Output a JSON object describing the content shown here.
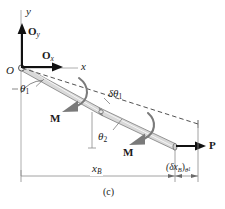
{
  "figure": {
    "caption": "(c)",
    "axes": {
      "y_axis_label": "y",
      "x_axis_label": "x"
    },
    "reactions": [
      {
        "name": "O-y-reaction",
        "base": "O",
        "subscript": "y"
      },
      {
        "name": "O-x-reaction",
        "base": "O",
        "subscript": "x"
      }
    ],
    "origin_label": "O",
    "angles": [
      {
        "name": "theta-1",
        "base": "θ",
        "subscript": "1"
      },
      {
        "name": "theta-2",
        "base": "θ",
        "subscript": "2"
      }
    ],
    "virtual_rotation": {
      "base": "δθ",
      "subscript": "1"
    },
    "moments": [
      {
        "name": "moment-upper",
        "label": "M"
      },
      {
        "name": "moment-lower",
        "label": "M"
      }
    ],
    "applied_force": {
      "label": "P"
    },
    "dimensions": [
      {
        "name": "x-B",
        "base": "x",
        "subscript": "B"
      },
      {
        "name": "delta-x-B",
        "prefix": "(δx",
        "sub_inner": "B",
        "mid": ")",
        "sub_outer": "θ",
        "sub_outer_num": "1"
      }
    ],
    "colors": {
      "ink": "#1a1a1a",
      "beam_fill": "#d9d9d9",
      "beam_edge": "#6e6e6e",
      "thin_line": "#8c8c8c",
      "dashed": "#4d4d4d"
    }
  }
}
